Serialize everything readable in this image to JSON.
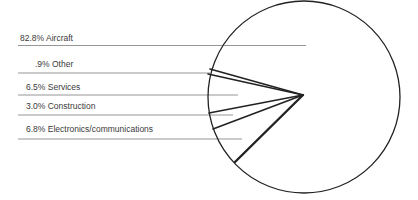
{
  "chart_data": {
    "type": "pie",
    "title": "",
    "categories": [
      "Aircraft",
      "Other",
      "Services",
      "Construction",
      "Electronics/communications"
    ],
    "values": [
      82.8,
      0.9,
      6.5,
      3.0,
      6.8
    ],
    "unit": "%",
    "legend_position": "left",
    "labels": [
      {
        "text": "82.8% Aircraft",
        "x": 20,
        "y": 41,
        "line_y": 45.5,
        "line_x2": 306
      },
      {
        "text": ".9% Other",
        "x": 35,
        "y": 67,
        "line_y": 73,
        "line_x2": 210
      },
      {
        "text": "6.5% Services",
        "x": 26,
        "y": 90,
        "line_y": 95,
        "line_x2": 238
      },
      {
        "text": "3.0% Construction",
        "x": 26,
        "y": 109,
        "line_y": 115,
        "line_x2": 233
      },
      {
        "text": "6.8% Electronics/communications",
        "x": 26,
        "y": 132,
        "line_y": 139,
        "line_x2": 242
      }
    ],
    "pie": {
      "cx": 304,
      "cy": 97,
      "r": 96,
      "hub": [
        303,
        95
      ],
      "spokes": [
        {
          "x": 210,
          "y": 69,
          "w": 1.6
        },
        {
          "x": 208,
          "y": 74,
          "w": 1.6
        },
        {
          "x": 209,
          "y": 113,
          "w": 1.6
        },
        {
          "x": 213,
          "y": 129,
          "w": 1.6
        },
        {
          "x": 235,
          "y": 162,
          "w": 2.4
        }
      ]
    },
    "colors": {
      "ink": "#222222",
      "leader": "#8a8a8a",
      "text": "#3a3a3a",
      "background": "#ffffff"
    }
  }
}
